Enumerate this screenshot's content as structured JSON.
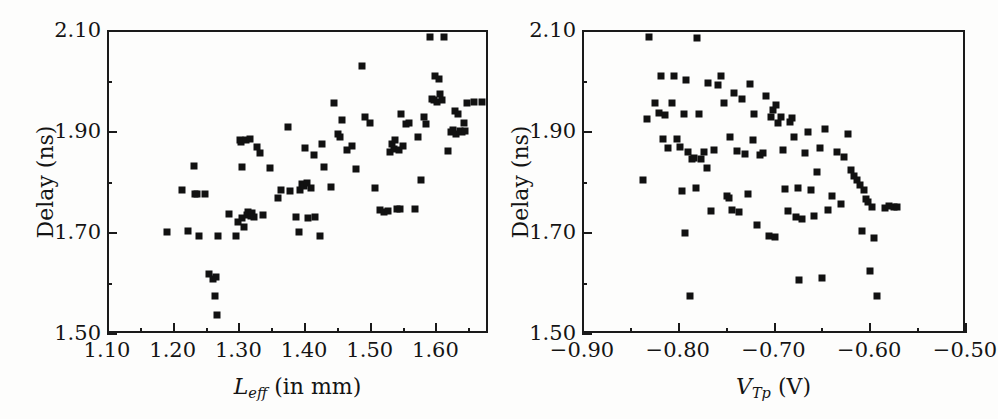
{
  "figure": {
    "background_color": "#fdfdfc",
    "marker_color": "#111111",
    "axis_color": "#1a1a1a",
    "panel_count": 2
  },
  "chart_data": [
    {
      "type": "scatter",
      "panel": "left",
      "title": "",
      "xlabel_parts": {
        "symbol": "L",
        "subscript": "eff",
        "suffix": " (in mm)"
      },
      "xlabel": "L_eff (in mm)",
      "ylabel": "Delay (ns)",
      "xlim": [
        1.1,
        1.68
      ],
      "ylim": [
        1.5,
        2.1
      ],
      "xticks": [
        1.1,
        1.2,
        1.3,
        1.4,
        1.5,
        1.6
      ],
      "xticklabels": [
        "1.10",
        "1.20",
        "1.30",
        "1.40",
        "1.50",
        "1.60"
      ],
      "xminor_step": 0.05,
      "yticks": [
        1.5,
        1.7,
        1.9,
        2.1
      ],
      "yticklabels": [
        "1.50",
        "1.70",
        "1.90",
        "2.10"
      ],
      "yminor_step": 0.1,
      "grid": false,
      "legend": null,
      "marker": "filled-square",
      "points": [
        [
          1.189,
          1.703
        ],
        [
          1.211,
          1.787
        ],
        [
          1.221,
          1.705
        ],
        [
          1.229,
          1.835
        ],
        [
          1.231,
          1.779
        ],
        [
          1.234,
          1.78
        ],
        [
          1.237,
          1.697
        ],
        [
          1.246,
          1.779
        ],
        [
          1.252,
          1.62
        ],
        [
          1.258,
          1.61
        ],
        [
          1.261,
          1.578
        ],
        [
          1.263,
          1.615
        ],
        [
          1.265,
          1.54
        ],
        [
          1.266,
          1.696
        ],
        [
          1.283,
          1.739
        ],
        [
          1.293,
          1.697
        ],
        [
          1.297,
          1.724
        ],
        [
          1.299,
          1.886
        ],
        [
          1.301,
          1.883
        ],
        [
          1.302,
          1.832
        ],
        [
          1.303,
          1.731
        ],
        [
          1.305,
          1.713
        ],
        [
          1.308,
          1.886
        ],
        [
          1.31,
          1.737
        ],
        [
          1.312,
          1.743
        ],
        [
          1.314,
          1.888
        ],
        [
          1.316,
          1.736
        ],
        [
          1.318,
          1.741
        ],
        [
          1.321,
          1.734
        ],
        [
          1.326,
          1.873
        ],
        [
          1.33,
          1.861
        ],
        [
          1.334,
          1.737
        ],
        [
          1.345,
          1.831
        ],
        [
          1.357,
          1.771
        ],
        [
          1.362,
          1.787
        ],
        [
          1.372,
          1.912
        ],
        [
          1.375,
          1.786
        ],
        [
          1.384,
          1.733
        ],
        [
          1.389,
          1.704
        ],
        [
          1.391,
          1.787
        ],
        [
          1.394,
          1.799
        ],
        [
          1.397,
          1.795
        ],
        [
          1.399,
          1.871
        ],
        [
          1.401,
          1.801
        ],
        [
          1.403,
          1.732
        ],
        [
          1.408,
          1.791
        ],
        [
          1.412,
          1.857
        ],
        [
          1.414,
          1.733
        ],
        [
          1.421,
          1.697
        ],
        [
          1.425,
          1.879
        ],
        [
          1.428,
          1.833
        ],
        [
          1.438,
          1.793
        ],
        [
          1.443,
          1.959
        ],
        [
          1.448,
          1.899
        ],
        [
          1.452,
          1.892
        ],
        [
          1.455,
          1.926
        ],
        [
          1.463,
          1.866
        ],
        [
          1.47,
          1.874
        ],
        [
          1.476,
          1.829
        ],
        [
          1.485,
          2.033
        ],
        [
          1.49,
          1.932
        ],
        [
          1.497,
          1.92
        ],
        [
          1.505,
          1.792
        ],
        [
          1.512,
          1.748
        ],
        [
          1.518,
          1.744
        ],
        [
          1.524,
          1.745
        ],
        [
          1.528,
          1.862
        ],
        [
          1.531,
          1.878
        ],
        [
          1.534,
          1.869
        ],
        [
          1.536,
          1.886
        ],
        [
          1.538,
          1.749
        ],
        [
          1.541,
          1.866
        ],
        [
          1.543,
          1.749
        ],
        [
          1.545,
          1.938
        ],
        [
          1.548,
          1.874
        ],
        [
          1.552,
          1.918
        ],
        [
          1.556,
          1.919
        ],
        [
          1.566,
          1.749
        ],
        [
          1.571,
          1.893
        ],
        [
          1.575,
          1.806
        ],
        [
          1.579,
          1.932
        ],
        [
          1.583,
          1.918
        ],
        [
          1.588,
          2.091
        ],
        [
          1.591,
          1.968
        ],
        [
          1.594,
          1.965
        ],
        [
          1.597,
          2.012
        ],
        [
          1.6,
          1.962
        ],
        [
          1.602,
          2.006
        ],
        [
          1.604,
          1.978
        ],
        [
          1.607,
          1.965
        ],
        [
          1.61,
          2.09
        ],
        [
          1.616,
          1.865
        ],
        [
          1.621,
          1.902
        ],
        [
          1.624,
          1.906
        ],
        [
          1.627,
          1.944
        ],
        [
          1.629,
          1.898
        ],
        [
          1.632,
          1.938
        ],
        [
          1.635,
          1.903
        ],
        [
          1.637,
          1.901
        ],
        [
          1.64,
          1.919
        ],
        [
          1.642,
          1.904
        ],
        [
          1.645,
          1.96
        ],
        [
          1.655,
          1.961
        ],
        [
          1.668,
          1.962
        ]
      ]
    },
    {
      "type": "scatter",
      "panel": "right",
      "title": "",
      "xlabel_parts": {
        "symbol": "V",
        "subscript": "Tp",
        "suffix": " (V)"
      },
      "xlabel": "V_Tp (V)",
      "ylabel": "Delay (ns)",
      "xlim": [
        -0.9,
        -0.5
      ],
      "ylim": [
        1.5,
        2.1
      ],
      "xticks": [
        -0.9,
        -0.8,
        -0.7,
        -0.6,
        -0.5
      ],
      "xticklabels": [
        "−0.90",
        "−0.80",
        "−0.70",
        "−0.60",
        "−0.50"
      ],
      "xminor_step": 0.05,
      "yticks": [
        1.5,
        1.7,
        1.9,
        2.1
      ],
      "yticklabels": [
        "1.50",
        "1.70",
        "1.90",
        "2.10"
      ],
      "yminor_step": 0.1,
      "grid": false,
      "legend": null,
      "marker": "filled-square",
      "points": [
        [
          -0.838,
          1.806
        ],
        [
          -0.834,
          1.928
        ],
        [
          -0.832,
          2.09
        ],
        [
          -0.826,
          1.959
        ],
        [
          -0.822,
          1.94
        ],
        [
          -0.82,
          2.013
        ],
        [
          -0.818,
          1.888
        ],
        [
          -0.815,
          1.936
        ],
        [
          -0.812,
          1.87
        ],
        [
          -0.808,
          1.96
        ],
        [
          -0.806,
          2.012
        ],
        [
          -0.803,
          1.889
        ],
        [
          -0.8,
          1.873
        ],
        [
          -0.798,
          1.785
        ],
        [
          -0.796,
          1.938
        ],
        [
          -0.795,
          1.701
        ],
        [
          -0.793,
          2.005
        ],
        [
          -0.791,
          1.862
        ],
        [
          -0.789,
          1.578
        ],
        [
          -0.787,
          1.848
        ],
        [
          -0.785,
          1.851
        ],
        [
          -0.783,
          1.791
        ],
        [
          -0.782,
          2.088
        ],
        [
          -0.78,
          1.937
        ],
        [
          -0.778,
          1.849
        ],
        [
          -0.775,
          1.862
        ],
        [
          -0.772,
          1.831
        ],
        [
          -0.77,
          2.0
        ],
        [
          -0.767,
          1.746
        ],
        [
          -0.764,
          1.867
        ],
        [
          -0.76,
          1.995
        ],
        [
          -0.757,
          2.013
        ],
        [
          -0.754,
          1.96
        ],
        [
          -0.751,
          1.775
        ],
        [
          -0.749,
          1.771
        ],
        [
          -0.747,
          1.892
        ],
        [
          -0.745,
          1.748
        ],
        [
          -0.743,
          1.979
        ],
        [
          -0.74,
          1.864
        ],
        [
          -0.738,
          1.744
        ],
        [
          -0.735,
          1.968
        ],
        [
          -0.732,
          1.859
        ],
        [
          -0.729,
          1.779
        ],
        [
          -0.727,
          1.998
        ],
        [
          -0.724,
          1.886
        ],
        [
          -0.722,
          1.938
        ],
        [
          -0.719,
          1.718
        ],
        [
          -0.716,
          1.856
        ],
        [
          -0.713,
          1.86
        ],
        [
          -0.71,
          1.974
        ],
        [
          -0.707,
          1.696
        ],
        [
          -0.705,
          1.931
        ],
        [
          -0.703,
          1.945
        ],
        [
          -0.701,
          1.694
        ],
        [
          -0.699,
          1.955
        ],
        [
          -0.697,
          1.92
        ],
        [
          -0.694,
          1.931
        ],
        [
          -0.692,
          1.867
        ],
        [
          -0.69,
          1.789
        ],
        [
          -0.687,
          1.745
        ],
        [
          -0.685,
          1.921
        ],
        [
          -0.683,
          1.93
        ],
        [
          -0.681,
          1.893
        ],
        [
          -0.679,
          1.733
        ],
        [
          -0.677,
          1.791
        ],
        [
          -0.675,
          1.608
        ],
        [
          -0.672,
          1.729
        ],
        [
          -0.669,
          1.861
        ],
        [
          -0.666,
          1.901
        ],
        [
          -0.663,
          1.788
        ],
        [
          -0.66,
          1.736
        ],
        [
          -0.657,
          1.823
        ],
        [
          -0.654,
          1.871
        ],
        [
          -0.651,
          1.613
        ],
        [
          -0.648,
          1.907
        ],
        [
          -0.645,
          1.748
        ],
        [
          -0.641,
          1.775
        ],
        [
          -0.636,
          1.862
        ],
        [
          -0.632,
          1.76
        ],
        [
          -0.628,
          1.852
        ],
        [
          -0.624,
          1.898
        ],
        [
          -0.621,
          1.826
        ],
        [
          -0.618,
          1.815
        ],
        [
          -0.615,
          1.806
        ],
        [
          -0.612,
          1.797
        ],
        [
          -0.61,
          1.705
        ],
        [
          -0.608,
          1.788
        ],
        [
          -0.606,
          1.77
        ],
        [
          -0.603,
          1.763
        ],
        [
          -0.601,
          1.627
        ],
        [
          -0.599,
          1.754
        ],
        [
          -0.597,
          1.693
        ],
        [
          -0.594,
          1.578
        ],
        [
          -0.586,
          1.752
        ],
        [
          -0.581,
          1.755
        ],
        [
          -0.576,
          1.753
        ],
        [
          -0.573,
          1.754
        ]
      ]
    }
  ]
}
